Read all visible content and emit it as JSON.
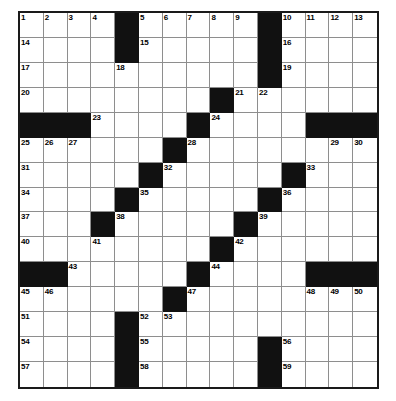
{
  "puzzle": {
    "type": "crossword-grid",
    "size": {
      "rows": 15,
      "cols": 15
    },
    "colors": {
      "block": "#111111",
      "cell": "#ffffff",
      "gridline": "#8e8e8e",
      "border": "#1a1a1a",
      "number_text": "#000000"
    },
    "blocks": [
      [
        0,
        4
      ],
      [
        0,
        10
      ],
      [
        1,
        4
      ],
      [
        1,
        10
      ],
      [
        2,
        10
      ],
      [
        3,
        8
      ],
      [
        4,
        0
      ],
      [
        4,
        1
      ],
      [
        4,
        2
      ],
      [
        4,
        7
      ],
      [
        4,
        12
      ],
      [
        4,
        13
      ],
      [
        4,
        14
      ],
      [
        5,
        6
      ],
      [
        6,
        5
      ],
      [
        6,
        11
      ],
      [
        7,
        4
      ],
      [
        7,
        10
      ],
      [
        8,
        3
      ],
      [
        8,
        9
      ],
      [
        9,
        8
      ],
      [
        10,
        0
      ],
      [
        10,
        1
      ],
      [
        10,
        7
      ],
      [
        10,
        12
      ],
      [
        10,
        13
      ],
      [
        10,
        14
      ],
      [
        11,
        6
      ],
      [
        12,
        4
      ],
      [
        13,
        4
      ],
      [
        13,
        10
      ],
      [
        14,
        4
      ],
      [
        14,
        10
      ]
    ],
    "numbers": [
      {
        "row": 0,
        "col": 0,
        "n": "1"
      },
      {
        "row": 0,
        "col": 1,
        "n": "2"
      },
      {
        "row": 0,
        "col": 2,
        "n": "3"
      },
      {
        "row": 0,
        "col": 3,
        "n": "4"
      },
      {
        "row": 0,
        "col": 5,
        "n": "5"
      },
      {
        "row": 0,
        "col": 6,
        "n": "6"
      },
      {
        "row": 0,
        "col": 7,
        "n": "7"
      },
      {
        "row": 0,
        "col": 8,
        "n": "8"
      },
      {
        "row": 0,
        "col": 9,
        "n": "9"
      },
      {
        "row": 0,
        "col": 11,
        "n": "10"
      },
      {
        "row": 0,
        "col": 12,
        "n": "11"
      },
      {
        "row": 0,
        "col": 13,
        "n": "12"
      },
      {
        "row": 0,
        "col": 14,
        "n": "13"
      },
      {
        "row": 1,
        "col": 0,
        "n": "14"
      },
      {
        "row": 1,
        "col": 5,
        "n": "15"
      },
      {
        "row": 1,
        "col": 11,
        "n": "16"
      },
      {
        "row": 2,
        "col": 0,
        "n": "17"
      },
      {
        "row": 2,
        "col": 4,
        "n": "18"
      },
      {
        "row": 2,
        "col": 11,
        "n": "19"
      },
      {
        "row": 3,
        "col": 0,
        "n": "20"
      },
      {
        "row": 3,
        "col": 9,
        "n": "21"
      },
      {
        "row": 3,
        "col": 10,
        "n": "22"
      },
      {
        "row": 4,
        "col": 3,
        "n": "23"
      },
      {
        "row": 4,
        "col": 8,
        "n": "24"
      },
      {
        "row": 5,
        "col": 0,
        "n": "25"
      },
      {
        "row": 5,
        "col": 1,
        "n": "26"
      },
      {
        "row": 5,
        "col": 2,
        "n": "27"
      },
      {
        "row": 5,
        "col": 7,
        "n": "28"
      },
      {
        "row": 5,
        "col": 13,
        "n": "29"
      },
      {
        "row": 5,
        "col": 14,
        "n": "30"
      },
      {
        "row": 6,
        "col": 0,
        "n": "31"
      },
      {
        "row": 6,
        "col": 6,
        "n": "32"
      },
      {
        "row": 6,
        "col": 12,
        "n": "33"
      },
      {
        "row": 7,
        "col": 0,
        "n": "34"
      },
      {
        "row": 7,
        "col": 5,
        "n": "35"
      },
      {
        "row": 7,
        "col": 11,
        "n": "36"
      },
      {
        "row": 8,
        "col": 0,
        "n": "37"
      },
      {
        "row": 8,
        "col": 4,
        "n": "38"
      },
      {
        "row": 8,
        "col": 10,
        "n": "39"
      },
      {
        "row": 9,
        "col": 0,
        "n": "40"
      },
      {
        "row": 9,
        "col": 3,
        "n": "41"
      },
      {
        "row": 9,
        "col": 9,
        "n": "42"
      },
      {
        "row": 10,
        "col": 2,
        "n": "43"
      },
      {
        "row": 10,
        "col": 8,
        "n": "44"
      },
      {
        "row": 11,
        "col": 0,
        "n": "45"
      },
      {
        "row": 11,
        "col": 1,
        "n": "46"
      },
      {
        "row": 11,
        "col": 7,
        "n": "47"
      },
      {
        "row": 11,
        "col": 12,
        "n": "48"
      },
      {
        "row": 11,
        "col": 13,
        "n": "49"
      },
      {
        "row": 11,
        "col": 14,
        "n": "50"
      },
      {
        "row": 12,
        "col": 0,
        "n": "51"
      },
      {
        "row": 12,
        "col": 5,
        "n": "52"
      },
      {
        "row": 12,
        "col": 6,
        "n": "53"
      },
      {
        "row": 13,
        "col": 0,
        "n": "54"
      },
      {
        "row": 13,
        "col": 5,
        "n": "55"
      },
      {
        "row": 13,
        "col": 11,
        "n": "56"
      },
      {
        "row": 14,
        "col": 0,
        "n": "57"
      },
      {
        "row": 14,
        "col": 5,
        "n": "58"
      },
      {
        "row": 14,
        "col": 11,
        "n": "59"
      }
    ]
  }
}
